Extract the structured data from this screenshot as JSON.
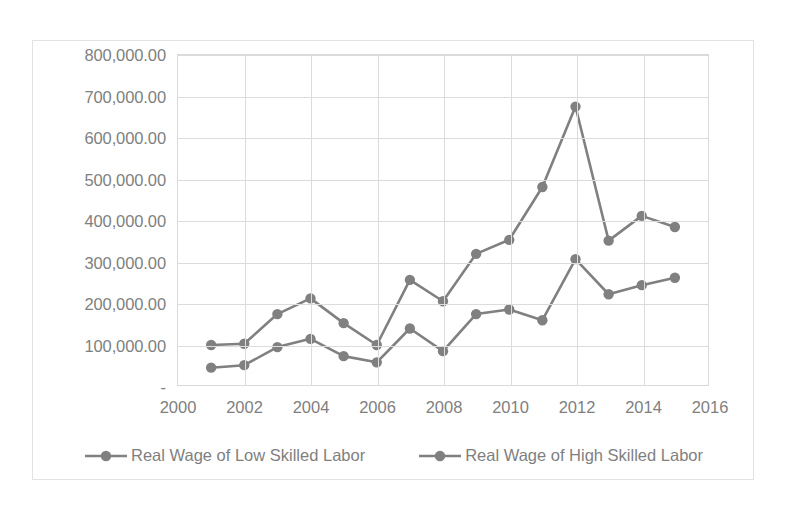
{
  "chart_data": {
    "type": "line",
    "title": "",
    "xlabel": "",
    "ylabel": "",
    "x": [
      2001,
      2002,
      2003,
      2004,
      2005,
      2006,
      2007,
      2008,
      2009,
      2010,
      2011,
      2012,
      2013,
      2014,
      2015
    ],
    "series": [
      {
        "name": "Real Wage of Low Skilled Labor",
        "color": "#808080",
        "values": [
          42000,
          48000,
          92000,
          112000,
          70000,
          55000,
          137000,
          82000,
          172000,
          183000,
          157000,
          305000,
          220000,
          242000,
          260000
        ]
      },
      {
        "name": "Real Wage of High Skilled Labor",
        "color": "#808080",
        "values": [
          97000,
          100000,
          172000,
          210000,
          150000,
          97000,
          255000,
          203000,
          318000,
          352000,
          480000,
          675000,
          350000,
          410000,
          383000
        ]
      }
    ],
    "xlim": [
      2000,
      2016
    ],
    "ylim": [
      0,
      800000
    ],
    "xticks": [
      2000,
      2002,
      2004,
      2006,
      2008,
      2010,
      2012,
      2014,
      2016
    ],
    "xtick_labels": [
      "2000",
      "2002",
      "2004",
      "2006",
      "2008",
      "2010",
      "2012",
      "2014",
      "2016"
    ],
    "yticks": [
      0,
      100000,
      200000,
      300000,
      400000,
      500000,
      600000,
      700000,
      800000
    ],
    "ytick_labels": [
      "-",
      "100,000.00",
      "200,000.00",
      "300,000.00",
      "400,000.00",
      "500,000.00",
      "600,000.00",
      "700,000.00",
      "800,000.00"
    ],
    "grid": "horizontal-and-vertical",
    "legend_position": "bottom",
    "marker": "circle",
    "axis_color": "#d9d9d9",
    "grid_color": "#dcdcdc",
    "text_color": "#7f7f7f"
  }
}
